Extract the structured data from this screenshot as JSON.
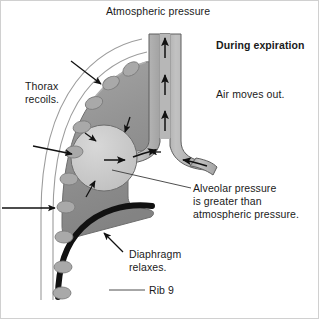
{
  "figure": {
    "title_context": "Mechanics of breathing — expiration",
    "background_color": "#ffffff",
    "border_color": "#c8c8c8"
  },
  "labels": {
    "atmospheric_pressure": "Atmospheric pressure",
    "during_expiration": "During expiration",
    "air_moves_out": "Air moves out.",
    "thorax_recoils_line1": "Thorax",
    "thorax_recoils_line2": "recoils.",
    "alveolar_line1": "Alveolar pressure",
    "alveolar_line2": "is greater than",
    "alveolar_line3": "atmospheric pressure.",
    "diaphragm_line1": "Diaphragm",
    "diaphragm_line2": "relaxes.",
    "rib9": "Rib 9"
  },
  "anatomy": {
    "lung": {
      "name": "lung",
      "fill_top": "#9a9a9a",
      "fill_bottom": "#8a8a8a",
      "stroke": "#6e6e6e"
    },
    "alveolus": {
      "name": "alveolus",
      "fill": "#c6c6c6",
      "stroke": "#6e6e6e",
      "cx": 104,
      "cy": 158,
      "r": 33
    },
    "trachea": {
      "name": "trachea",
      "fill": "#b4b4b4",
      "stroke": "#5a5a5a"
    },
    "bronchus": {
      "name": "bronchus",
      "fill": "#b4b4b4",
      "stroke": "#5a5a5a"
    },
    "diaphragm": {
      "name": "diaphragm",
      "stroke": "#111111",
      "stroke_width": 6
    },
    "thorax_wall": {
      "name": "thorax-wall",
      "stroke": "#9a9a9a"
    },
    "ribs": {
      "name": "ribs",
      "count": 9,
      "fill": "#a8a8a8",
      "stroke": "#7a7a7a"
    }
  },
  "arrows": {
    "airflow_color": "#111111",
    "recoil_color": "#111111",
    "leader_color": "#444444",
    "trachea_up_count": 3,
    "alveolus_inward_count": 4
  }
}
